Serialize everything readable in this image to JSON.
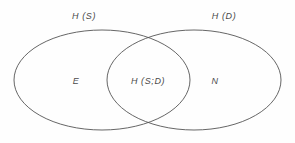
{
  "diagram": {
    "type": "venn-diagram",
    "background_color": "#fefefe",
    "stroke_color": "#555555",
    "text_color": "#4a4a4a",
    "set_titles": [
      {
        "text": "H (S)",
        "x": 84,
        "y": 16
      },
      {
        "text": "H (D)",
        "x": 224,
        "y": 16
      }
    ],
    "regions": [
      {
        "name": "left-only",
        "text": "E",
        "x": 76,
        "y": 81
      },
      {
        "name": "intersection",
        "text": "H (S;D)",
        "x": 148,
        "y": 81
      },
      {
        "name": "right-only",
        "text": "N",
        "x": 215,
        "y": 81
      }
    ],
    "ellipses": [
      {
        "name": "left-ellipse",
        "cx": 102,
        "cy": 80,
        "rx": 88,
        "ry": 50
      },
      {
        "name": "right-ellipse",
        "cx": 194,
        "cy": 80,
        "rx": 87,
        "ry": 50
      }
    ]
  }
}
